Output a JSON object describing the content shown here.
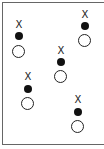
{
  "diagram": {
    "marker_label": "X",
    "groups": [
      {
        "cx": 19,
        "x_y": 20,
        "dot_y": 32,
        "ring_y": 45
      },
      {
        "cx": 28,
        "x_y": 72,
        "dot_y": 85,
        "ring_y": 97
      },
      {
        "cx": 61,
        "x_y": 46,
        "dot_y": 58,
        "ring_y": 70
      },
      {
        "cx": 85,
        "x_y": 10,
        "dot_y": 22,
        "ring_y": 34
      },
      {
        "cx": 78,
        "x_y": 95,
        "dot_y": 108,
        "ring_y": 120
      }
    ]
  }
}
